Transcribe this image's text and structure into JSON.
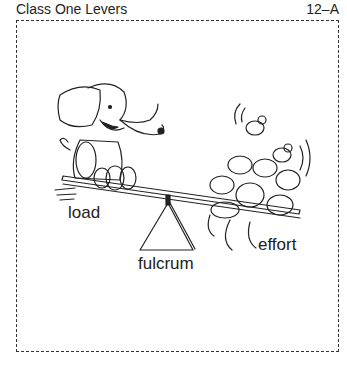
{
  "header": {
    "title": "Class One Levers",
    "page_number": "12–A"
  },
  "illustration": {
    "description": "Elephant sitting on one end of a seesaw balanced on a triangular fulcrum, a pile of mice on the other end",
    "labels": {
      "load": "load",
      "fulcrum": "fulcrum",
      "effort": "effort"
    }
  }
}
